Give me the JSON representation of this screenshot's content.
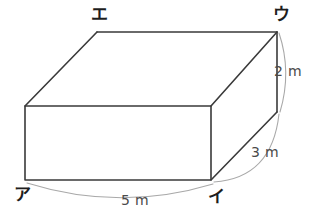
{
  "figure": {
    "shape": "rectangular-prism",
    "background_color": "#ffffff",
    "edge_color": "#3a3a3a",
    "arc_color": "#a9a9a9",
    "label_color": "#1d1d1d",
    "dimension_text_color": "#4a4a4a",
    "vertices": [
      {
        "id": "a",
        "label": "ア",
        "x": 22,
        "y": 200,
        "anchor": "middle",
        "corner": "front-bottom-left"
      },
      {
        "id": "i",
        "label": "イ",
        "x": 216,
        "y": 202,
        "anchor": "middle",
        "corner": "front-bottom-right"
      },
      {
        "id": "u",
        "label": "ウ",
        "x": 281,
        "y": 20,
        "anchor": "middle",
        "corner": "back-top-right"
      },
      {
        "id": "e",
        "label": "エ",
        "x": 99,
        "y": 20,
        "anchor": "middle",
        "corner": "back-top-left"
      }
    ],
    "dimensions": [
      {
        "id": "width",
        "label": "5 m",
        "value": 5,
        "unit": "m",
        "between": [
          "ア",
          "イ"
        ],
        "x": 135,
        "y": 205
      },
      {
        "id": "depth",
        "label": "3 m",
        "value": 3,
        "unit": "m",
        "between": [
          "イ",
          "ウ"
        ],
        "x": 265,
        "y": 157
      },
      {
        "id": "height",
        "label": "2 m",
        "value": 2,
        "unit": "m",
        "between": [
          "ウ",
          "front-right-bottom"
        ],
        "x": 287,
        "y": 76
      }
    ],
    "geometry": {
      "front_face": {
        "x1": 25,
        "y1": 106,
        "x2": 211,
        "y2": 180
      },
      "back_top_edge": {
        "x1": 97,
        "y1": 32,
        "x2": 277,
        "y2": 32
      },
      "left_diagonal": {
        "x1": 25,
        "y1": 106,
        "x2": 97,
        "y2": 32
      },
      "right_diagonal_top": {
        "x1": 211,
        "y1": 106,
        "x2": 277,
        "y2": 32
      },
      "right_vertical": {
        "x1": 277,
        "y1": 32,
        "x2": 277,
        "y2": 112
      },
      "right_diagonal_bottom": {
        "x1": 211,
        "y1": 180,
        "x2": 277,
        "y2": 112
      }
    }
  }
}
